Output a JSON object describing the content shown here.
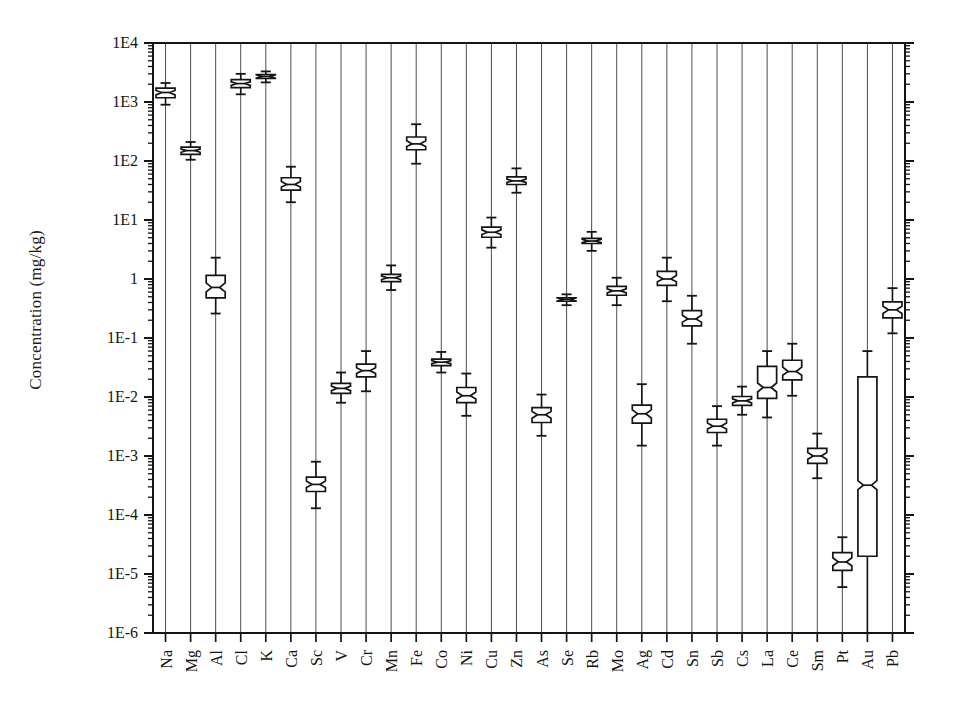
{
  "chart_data": {
    "type": "box",
    "title": "",
    "xlabel": "",
    "ylabel": "Concentration (mg/kg)",
    "yscale": "log",
    "ylim": [
      1e-06,
      10000.0
    ],
    "grid": "vertical-only",
    "legend": "none",
    "notched": true,
    "ytick_labels": [
      "1E4",
      "1E3",
      "1E2",
      "1E1",
      "1",
      "1E-1",
      "1E-2",
      "1E-3",
      "1E-4",
      "1E-5",
      "1E-6"
    ],
    "ytick_values": [
      10000,
      1000,
      100,
      10,
      1,
      0.1,
      0.01,
      0.001,
      0.0001,
      1e-05,
      1e-06
    ],
    "categories": [
      "Na",
      "Mg",
      "Al",
      "Cl",
      "K",
      "Ca",
      "Sc",
      "V",
      "Cr",
      "Mn",
      "Fe",
      "Co",
      "Ni",
      "Cu",
      "Zn",
      "As",
      "Se",
      "Rb",
      "Mo",
      "Ag",
      "Cd",
      "Sn",
      "Sb",
      "Cs",
      "La",
      "Ce",
      "Sm",
      "Pt",
      "Au",
      "Pb"
    ],
    "boxes": [
      {
        "category": "Na",
        "whisker_low": 900.0,
        "q1": 1180.0,
        "median": 1450.0,
        "q3": 1720.0,
        "whisker_high": 2100.0
      },
      {
        "category": "Mg",
        "whisker_low": 105.0,
        "q1": 130.0,
        "median": 150.0,
        "q3": 172.0,
        "whisker_high": 210.0
      },
      {
        "category": "Al",
        "whisker_low": 0.26,
        "q1": 0.48,
        "median": 0.72,
        "q3": 1.15,
        "whisker_high": 2.3
      },
      {
        "category": "Cl",
        "whisker_low": 1350.0,
        "q1": 1750.0,
        "median": 2050.0,
        "q3": 2400.0,
        "whisker_high": 3000.0
      },
      {
        "category": "K",
        "whisker_low": 2150.0,
        "q1": 2500.0,
        "median": 2700.0,
        "q3": 2900.0,
        "whisker_high": 3300.0
      },
      {
        "category": "Ca",
        "whisker_low": 20.0,
        "q1": 32.0,
        "median": 40.0,
        "q3": 52.0,
        "whisker_high": 80.0
      },
      {
        "category": "Sc",
        "whisker_low": 0.00013,
        "q1": 0.00025,
        "median": 0.00033,
        "q3": 0.00044,
        "whisker_high": 0.0008
      },
      {
        "category": "V",
        "whisker_low": 0.008,
        "q1": 0.0115,
        "median": 0.014,
        "q3": 0.017,
        "whisker_high": 0.026
      },
      {
        "category": "Cr",
        "whisker_low": 0.0125,
        "q1": 0.022,
        "median": 0.028,
        "q3": 0.036,
        "whisker_high": 0.06
      },
      {
        "category": "Mn",
        "whisker_low": 0.65,
        "q1": 0.9,
        "median": 1.05,
        "q3": 1.2,
        "whisker_high": 1.7
      },
      {
        "category": "Fe",
        "whisker_low": 90.0,
        "q1": 155.0,
        "median": 195.0,
        "q3": 255.0,
        "whisker_high": 420.0
      },
      {
        "category": "Co",
        "whisker_low": 0.026,
        "q1": 0.034,
        "median": 0.039,
        "q3": 0.044,
        "whisker_high": 0.058
      },
      {
        "category": "Ni",
        "whisker_low": 0.0048,
        "q1": 0.008,
        "median": 0.0105,
        "q3": 0.0145,
        "whisker_high": 0.025
      },
      {
        "category": "Cu",
        "whisker_low": 3.4,
        "q1": 5.1,
        "median": 6.2,
        "q3": 7.6,
        "whisker_high": 11.0
      },
      {
        "category": "Zn",
        "whisker_low": 29.0,
        "q1": 40.0,
        "median": 46.0,
        "q3": 54.0,
        "whisker_high": 75.0
      },
      {
        "category": "As",
        "whisker_low": 0.0022,
        "q1": 0.0037,
        "median": 0.005,
        "q3": 0.0066,
        "whisker_high": 0.011
      },
      {
        "category": "Se",
        "whisker_low": 0.36,
        "q1": 0.42,
        "median": 0.45,
        "q3": 0.48,
        "whisker_high": 0.55
      },
      {
        "category": "Rb",
        "whisker_low": 3.0,
        "q1": 4.0,
        "median": 4.4,
        "q3": 4.9,
        "whisker_high": 6.3
      },
      {
        "category": "Mo",
        "whisker_low": 0.36,
        "q1": 0.53,
        "median": 0.63,
        "q3": 0.75,
        "whisker_high": 1.05
      },
      {
        "category": "Ag",
        "whisker_low": 0.0015,
        "q1": 0.0036,
        "median": 0.0052,
        "q3": 0.0073,
        "whisker_high": 0.0165
      },
      {
        "category": "Cd",
        "whisker_low": 0.42,
        "q1": 0.78,
        "median": 1.0,
        "q3": 1.35,
        "whisker_high": 2.3
      },
      {
        "category": "Sn",
        "whisker_low": 0.08,
        "q1": 0.16,
        "median": 0.21,
        "q3": 0.29,
        "whisker_high": 0.52
      },
      {
        "category": "Sb",
        "whisker_low": 0.0015,
        "q1": 0.0025,
        "median": 0.0032,
        "q3": 0.0042,
        "whisker_high": 0.007
      },
      {
        "category": "Cs",
        "whisker_low": 0.005,
        "q1": 0.0072,
        "median": 0.0086,
        "q3": 0.0102,
        "whisker_high": 0.015
      },
      {
        "category": "La",
        "whisker_low": 0.0045,
        "q1": 0.0095,
        "median": 0.0145,
        "q3": 0.033,
        "whisker_high": 0.06
      },
      {
        "category": "Ce",
        "whisker_low": 0.0105,
        "q1": 0.0195,
        "median": 0.027,
        "q3": 0.042,
        "whisker_high": 0.08
      },
      {
        "category": "Sm",
        "whisker_low": 0.00042,
        "q1": 0.00075,
        "median": 0.001,
        "q3": 0.00135,
        "whisker_high": 0.0024
      },
      {
        "category": "Pt",
        "whisker_low": 6e-06,
        "q1": 1.15e-05,
        "median": 1.6e-05,
        "q3": 2.3e-05,
        "whisker_high": 4.2e-05
      },
      {
        "category": "Au",
        "whisker_low": 1e-06,
        "q1": 2e-05,
        "median": 0.00032,
        "q3": 0.022,
        "whisker_high": 0.06
      },
      {
        "category": "Pb",
        "whisker_low": 0.12,
        "q1": 0.22,
        "median": 0.3,
        "q3": 0.41,
        "whisker_high": 0.7
      }
    ]
  },
  "axes": {
    "y_title": "Concentration (mg/kg)"
  },
  "style": {
    "line_color": "#151515",
    "background": "#ffffff",
    "box_fill": "#ffffff"
  }
}
